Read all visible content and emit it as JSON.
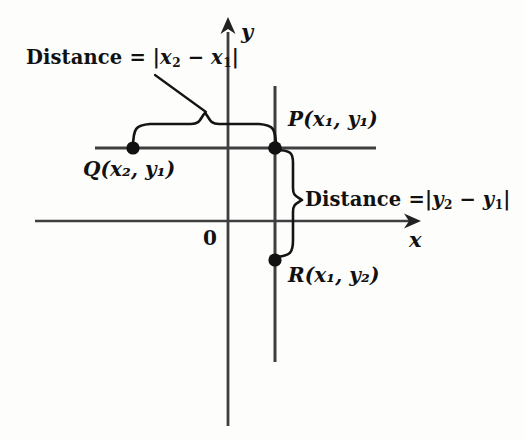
{
  "figure": {
    "background_color": "#fdfdfc",
    "line_color": "#3a3a3a",
    "ink_color": "#111111"
  },
  "axes": {
    "x_axis_label": "x",
    "y_axis_label": "y",
    "origin_label": "0",
    "x_axis": {
      "x1": 35,
      "x2": 418,
      "y": 221,
      "arrow": "right"
    },
    "y_axis": {
      "x": 228,
      "y1": 25,
      "y2": 426,
      "arrow": "up"
    }
  },
  "points": [
    {
      "id": "P",
      "label_name": "P",
      "label_coords": "(x₁, y₁)",
      "x": 275,
      "y": 148,
      "label_x": 288,
      "label_y": 120
    },
    {
      "id": "Q",
      "label_name": "Q",
      "label_coords": "(x₂, y₁)",
      "x": 133,
      "y": 148,
      "label_x": 84,
      "label_y": 160
    },
    {
      "id": "R",
      "label_name": "R",
      "label_coords": "(x₁, y₂)",
      "x": 275,
      "y": 260,
      "label_x": 288,
      "label_y": 268
    }
  ],
  "guide_lines": [
    {
      "name": "horizontal-line-through-Q-and-P",
      "x1": 95,
      "y1": 148,
      "x2": 376,
      "y2": 148
    },
    {
      "name": "vertical-line-through-P-and-R",
      "x1": 275,
      "y1": 86,
      "x2": 275,
      "y2": 362
    }
  ],
  "annotations": {
    "horizontal_distance": {
      "text_prefix": "Distance",
      "equals": "=",
      "expression": "|x₂ − x₁|",
      "expr_open": "|",
      "expr_a": "x",
      "expr_a_sub": "2",
      "minus": "−",
      "expr_b": "x",
      "expr_b_sub": "1",
      "expr_close": "|",
      "label_x": 26,
      "label_y": 50,
      "brace_from_x": 133,
      "brace_to_x": 275,
      "brace_y": 130
    },
    "vertical_distance": {
      "text_prefix": "Distance",
      "equals": "=",
      "expression": "|y₂ − y₁|",
      "expr_open": "|",
      "expr_a": "y",
      "expr_a_sub": "2",
      "minus": "−",
      "expr_b": "y",
      "expr_b_sub": "1",
      "expr_close": "|",
      "label_x": 304,
      "label_y": 190,
      "brace_from_y": 148,
      "brace_to_y": 260,
      "brace_x": 292
    }
  }
}
